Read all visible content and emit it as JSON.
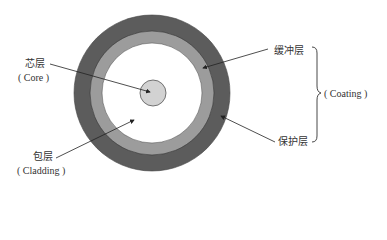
{
  "diagram": {
    "type": "optical-fiber-cross-section",
    "layers": [
      {
        "id": "core",
        "label_zh": "芯层",
        "label_en": "( Core )",
        "color": "#d2d2d2"
      },
      {
        "id": "cladding",
        "label_zh": "包层",
        "label_en": "( Cladding )",
        "color": "#ffffff"
      },
      {
        "id": "buffer",
        "label_zh": "缓冲层",
        "color": "#9c9c9c"
      },
      {
        "id": "protective",
        "label_zh": "保护层",
        "color": "#5c5c5c"
      }
    ],
    "group": {
      "label_en": "( Coating )",
      "members": [
        "缓冲层",
        "保护层"
      ]
    }
  },
  "labels": {
    "core_zh": "芯层",
    "core_en": "( Core )",
    "cladding_zh": "包层",
    "cladding_en": "( Cladding )",
    "buffer_zh": "缓冲层",
    "protective_zh": "保护层",
    "coating_en": "( Coating )"
  }
}
